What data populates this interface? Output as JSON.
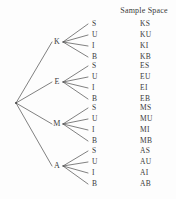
{
  "figure": {
    "title": "Sample Space",
    "root": {
      "label": ""
    },
    "branches": [
      {
        "letter": "K",
        "y": 42,
        "leaves": [
          {
            "label": "S",
            "outcome": "KS",
            "y": 24
          },
          {
            "label": "U",
            "outcome": "KU",
            "y": 35
          },
          {
            "label": "I",
            "outcome": "KI",
            "y": 46
          },
          {
            "label": "B",
            "outcome": "KB",
            "y": 57
          }
        ]
      },
      {
        "letter": "E",
        "y": 82,
        "leaves": [
          {
            "label": "S",
            "outcome": "ES",
            "y": 66
          },
          {
            "label": "U",
            "outcome": "EU",
            "y": 77
          },
          {
            "label": "I",
            "outcome": "EI",
            "y": 88
          },
          {
            "label": "B",
            "outcome": "EB",
            "y": 99
          }
        ]
      },
      {
        "letter": "M",
        "y": 124,
        "leaves": [
          {
            "label": "S",
            "outcome": "MS",
            "y": 108
          },
          {
            "label": "U",
            "outcome": "MU",
            "y": 119
          },
          {
            "label": "I",
            "outcome": "MI",
            "y": 130
          },
          {
            "label": "B",
            "outcome": "MB",
            "y": 141
          }
        ]
      },
      {
        "letter": "A",
        "y": 166,
        "leaves": [
          {
            "label": "S",
            "outcome": "AS",
            "y": 151
          },
          {
            "label": "U",
            "outcome": "AU",
            "y": 162
          },
          {
            "label": "I",
            "outcome": "AI",
            "y": 173
          },
          {
            "label": "B",
            "outcome": "AB",
            "y": 184
          }
        ]
      }
    ],
    "colors": {
      "line": "#4a4a4a",
      "text": "#3a3a3a",
      "background": "#fdfdfd"
    },
    "geometry": {
      "root_x": 16,
      "root_y": 103,
      "node_x": 57,
      "leaf_x": 92,
      "space_x": 140,
      "branch_start_x": 22,
      "branch_end_x": 52,
      "leaf_start_x": 63,
      "leaf_end_x": 88
    }
  }
}
